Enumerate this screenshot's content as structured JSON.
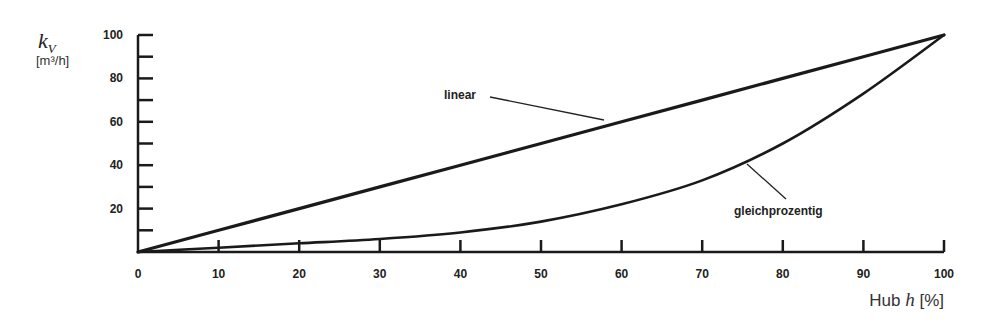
{
  "chart_data": {
    "type": "line",
    "title": "",
    "xlabel": "Hub h [%]",
    "ylabel": "kV [m³/h]",
    "xlim": [
      0,
      100
    ],
    "ylim": [
      0,
      100
    ],
    "grid": false,
    "legend": "none (inline annotations)",
    "x_ticks": [
      0,
      10,
      20,
      30,
      40,
      50,
      60,
      70,
      80,
      90,
      100
    ],
    "y_ticks": [
      20,
      40,
      60,
      80,
      100
    ],
    "y_minor_ticks": [
      10,
      30,
      50,
      70,
      90
    ],
    "x": [
      0,
      10,
      20,
      30,
      40,
      50,
      60,
      70,
      80,
      90,
      100
    ],
    "series": [
      {
        "name": "linear",
        "values": [
          0,
          10,
          20,
          30,
          40,
          50,
          60,
          70,
          80,
          90,
          100
        ]
      },
      {
        "name": "gleichprozentig",
        "values": [
          0,
          2,
          4,
          6,
          9,
          14,
          22,
          33,
          50,
          73,
          100
        ]
      }
    ],
    "annotations": [
      {
        "text": "linear",
        "points_to": [
          57,
          61
        ]
      },
      {
        "text": "gleichprozentig",
        "points_to": [
          74,
          40
        ]
      }
    ]
  },
  "axis": {
    "y_symbol": "k",
    "y_subscript": "V",
    "y_unit": "[m³/h]",
    "x_label_prefix": "Hub ",
    "x_label_var": "h",
    "x_label_suffix": " [%]",
    "x_tick_labels": [
      "0",
      "10",
      "20",
      "30",
      "40",
      "50",
      "60",
      "70",
      "80",
      "90",
      "100"
    ],
    "y_tick_labels": [
      "20",
      "40",
      "60",
      "80",
      "100"
    ]
  },
  "labels": {
    "linear": "linear",
    "equal_percentage": "gleichprozentig"
  }
}
